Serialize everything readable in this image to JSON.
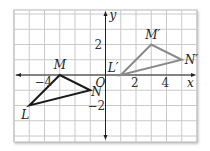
{
  "diagram": {
    "type": "coordinate-grid-translation",
    "grid": {
      "x_range": [
        -6,
        6
      ],
      "y_range": [
        -4,
        4
      ],
      "line_color": "#c9c9c9",
      "background": "#ffffff",
      "border_color": "#b8b8b8"
    },
    "axes": {
      "x_label": "x",
      "y_label": "y",
      "origin_label": "O",
      "color": "#222222",
      "x_ticks": [
        {
          "value": -4,
          "label": "−4"
        },
        {
          "value": 2,
          "label": "2"
        },
        {
          "value": 4,
          "label": "4"
        }
      ],
      "y_ticks": [
        {
          "value": 2,
          "label": "2"
        },
        {
          "value": -2,
          "label": "−2"
        }
      ]
    },
    "preimage": {
      "name": "triangle LMN",
      "color": "#1a1a1a",
      "vertices": [
        {
          "label": "L",
          "x": -5,
          "y": -2
        },
        {
          "label": "M",
          "x": -3,
          "y": 0
        },
        {
          "label": "N",
          "x": -1,
          "y": -1
        }
      ]
    },
    "image": {
      "name": "triangle L'M'N'",
      "color": "#8a8a8a",
      "vertices": [
        {
          "label": "L′",
          "x": 1,
          "y": 0
        },
        {
          "label": "M′",
          "x": 3,
          "y": 2
        },
        {
          "label": "N′",
          "x": 5,
          "y": 1
        }
      ]
    },
    "translation": {
      "dx": 6,
      "dy": 2
    }
  }
}
